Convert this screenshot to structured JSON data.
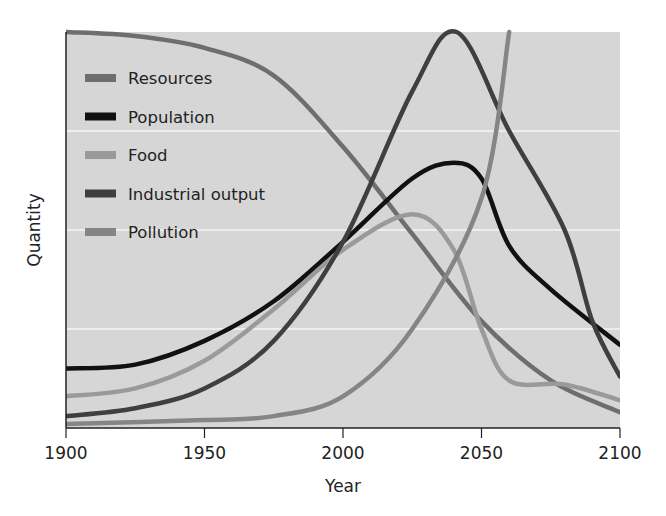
{
  "chart_data": {
    "type": "line",
    "title": "",
    "xlabel": "Year",
    "ylabel": "Quantity",
    "xlim": [
      1900,
      2100
    ],
    "ylim": [
      0,
      100
    ],
    "x_ticks": [
      1900,
      1950,
      2000,
      2050,
      2100
    ],
    "y_ticks": [],
    "grid": {
      "horizontal": true,
      "vertical": false,
      "lines_at": [
        25,
        50,
        75
      ]
    },
    "legend_position": "upper-left-inside",
    "series": [
      {
        "name": "Resources",
        "color": "#6e6e6e",
        "points": [
          [
            1900,
            100
          ],
          [
            1925,
            99
          ],
          [
            1950,
            96
          ],
          [
            1975,
            89
          ],
          [
            2000,
            71
          ],
          [
            2025,
            49
          ],
          [
            2050,
            27
          ],
          [
            2075,
            12
          ],
          [
            2100,
            4
          ]
        ]
      },
      {
        "name": "Population",
        "color": "#111111",
        "points": [
          [
            1900,
            15
          ],
          [
            1925,
            16
          ],
          [
            1950,
            22
          ],
          [
            1975,
            32
          ],
          [
            2000,
            47
          ],
          [
            2025,
            63
          ],
          [
            2040,
            67
          ],
          [
            2050,
            63
          ],
          [
            2060,
            46
          ],
          [
            2075,
            35
          ],
          [
            2100,
            21
          ]
        ]
      },
      {
        "name": "Food",
        "color": "#9a9a9a",
        "points": [
          [
            1900,
            8
          ],
          [
            1925,
            10
          ],
          [
            1950,
            17
          ],
          [
            1975,
            30
          ],
          [
            2000,
            45
          ],
          [
            2025,
            54
          ],
          [
            2040,
            45
          ],
          [
            2050,
            25
          ],
          [
            2060,
            12
          ],
          [
            2080,
            11
          ],
          [
            2100,
            7
          ]
        ]
      },
      {
        "name": "Industrial output",
        "color": "#3f3f3f",
        "points": [
          [
            1900,
            3
          ],
          [
            1925,
            5
          ],
          [
            1950,
            10
          ],
          [
            1975,
            22
          ],
          [
            2000,
            47
          ],
          [
            2025,
            85
          ],
          [
            2041,
            100
          ],
          [
            2060,
            75
          ],
          [
            2080,
            50
          ],
          [
            2090,
            27
          ],
          [
            2100,
            13
          ]
        ]
      },
      {
        "name": "Pollution",
        "color": "#858585",
        "points": [
          [
            1900,
            1
          ],
          [
            1950,
            2
          ],
          [
            1975,
            3
          ],
          [
            2000,
            8
          ],
          [
            2025,
            25
          ],
          [
            2050,
            58
          ],
          [
            2060,
            100
          ]
        ]
      }
    ]
  }
}
